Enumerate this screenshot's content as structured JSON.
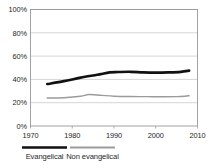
{
  "chart_data": {
    "type": "line",
    "title": "",
    "subtitle": "",
    "xlabel": "",
    "ylabel": "",
    "xlim": [
      1970,
      2010
    ],
    "ylim": [
      0,
      100
    ],
    "grid": true,
    "legend_position": "bottom",
    "y_ticks": [
      "0%",
      "20%",
      "40%",
      "60%",
      "80%",
      "100%"
    ],
    "y_tick_values": [
      0,
      20,
      40,
      60,
      80,
      100
    ],
    "x_ticks": [
      "1970",
      "1980",
      "1990",
      "2000",
      "2010"
    ],
    "x_tick_values": [
      1970,
      1980,
      1990,
      2000,
      2010
    ],
    "series": [
      {
        "name": "Evangelical",
        "color": "#111111",
        "width": 2.6,
        "x": [
          1974,
          1978,
          1982,
          1986,
          1989,
          1991,
          1994,
          1997,
          2000,
          2003,
          2006,
          2008
        ],
        "values": [
          36,
          38.5,
          41.5,
          44,
          46,
          46.3,
          46.5,
          46,
          45.8,
          46,
          46.5,
          47.5
        ]
      },
      {
        "name": "Non evangelical",
        "color": "#9b9b9b",
        "width": 1.4,
        "x": [
          1974,
          1978,
          1982,
          1984,
          1987,
          1990,
          1994,
          1998,
          2002,
          2005,
          2007,
          2008
        ],
        "values": [
          24,
          24.3,
          25.5,
          27,
          26.3,
          25.6,
          25.3,
          25.2,
          25.1,
          25.2,
          25.6,
          26
        ]
      }
    ]
  },
  "legend": {
    "items": [
      {
        "label": "Evangelical",
        "color": "#111111",
        "width": 2.6
      },
      {
        "label": "Non evangelical",
        "color": "#9b9b9b",
        "width": 1.8
      }
    ]
  }
}
